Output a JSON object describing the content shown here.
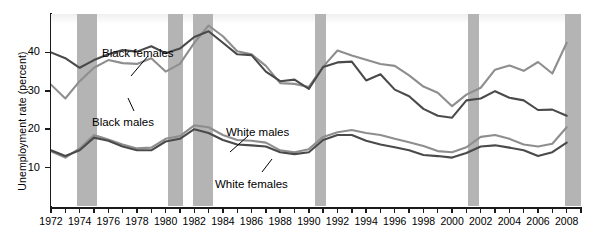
{
  "chart_data": {
    "type": "line",
    "title": "",
    "xlabel": "",
    "ylabel": "Unemployment rate (percent)",
    "xlim": [
      1972,
      2009
    ],
    "ylim": [
      0,
      50
    ],
    "yticks": [
      10,
      20,
      30,
      40
    ],
    "ytick_labels": [
      "10",
      "20",
      "30",
      "40"
    ],
    "x": [
      1972,
      1973,
      1974,
      1975,
      1976,
      1977,
      1978,
      1979,
      1980,
      1981,
      1982,
      1983,
      1984,
      1985,
      1986,
      1987,
      1988,
      1989,
      1990,
      1991,
      1992,
      1993,
      1994,
      1995,
      1996,
      1997,
      1998,
      1999,
      2000,
      2001,
      2002,
      2003,
      2004,
      2005,
      2006,
      2007,
      2008
    ],
    "xtick_labels": [
      "1972",
      "1974",
      "1976",
      "1978",
      "1980",
      "1982",
      "1984",
      "1986",
      "1988",
      "1990",
      "1992",
      "1994",
      "1996",
      "1998",
      "2000",
      "2002",
      "2004",
      "2006",
      "2008"
    ],
    "grid": false,
    "legend": "inline-annotations",
    "series": [
      {
        "name": "Black females",
        "color": "#4a4a4a",
        "values": [
          40.0,
          38.5,
          36.0,
          38.0,
          39.5,
          40.6,
          40.2,
          41.6,
          39.8,
          41.0,
          44.0,
          45.5,
          42.5,
          39.5,
          39.3,
          35.0,
          32.5,
          32.9,
          30.5,
          36.2,
          37.4,
          37.6,
          32.7,
          34.3,
          30.3,
          28.6,
          25.3,
          23.5,
          23.0,
          27.5,
          28.0,
          29.9,
          28.2,
          27.5,
          25.0,
          25.1,
          23.5
        ]
      },
      {
        "name": "Black males",
        "color": "#8e8e8e",
        "values": [
          31.6,
          28.0,
          32.5,
          36.0,
          38.0,
          37.2,
          37.0,
          38.5,
          35.0,
          37.0,
          42.5,
          47.0,
          44.2,
          40.3,
          39.5,
          36.5,
          32.0,
          31.8,
          31.0,
          36.3,
          40.5,
          39.2,
          38.1,
          37.0,
          36.5,
          34.0,
          31.1,
          29.5,
          26.0,
          29.0,
          30.8,
          35.5,
          36.6,
          35.2,
          37.5,
          34.5,
          42.5
        ]
      },
      {
        "name": "White males",
        "color": "#8e8e8e",
        "values": [
          14.2,
          12.6,
          15.0,
          18.5,
          17.3,
          16.0,
          15.0,
          15.2,
          17.5,
          18.2,
          21.0,
          20.5,
          18.5,
          17.2,
          17.0,
          16.5,
          14.5,
          14.0,
          14.8,
          18.0,
          19.2,
          19.8,
          19.0,
          18.5,
          17.5,
          16.6,
          15.6,
          14.3,
          14.0,
          15.3,
          18.0,
          18.5,
          17.5,
          16.0,
          15.5,
          16.2,
          20.5
        ]
      },
      {
        "name": "White females",
        "color": "#4a4a4a",
        "values": [
          14.5,
          13.0,
          14.5,
          17.8,
          17.0,
          15.5,
          14.5,
          14.5,
          16.8,
          17.5,
          20.0,
          19.0,
          17.2,
          16.0,
          15.8,
          15.5,
          14.0,
          13.5,
          14.0,
          17.2,
          18.5,
          18.5,
          17.0,
          16.0,
          15.3,
          14.5,
          13.3,
          13.0,
          12.6,
          13.8,
          15.5,
          15.8,
          15.2,
          14.5,
          13.0,
          14.0,
          16.5
        ]
      }
    ],
    "recession_bands": [
      {
        "start": 1973.8,
        "end": 1975.2
      },
      {
        "start": 1980.2,
        "end": 1981.2
      },
      {
        "start": 1981.9,
        "end": 1983.3
      },
      {
        "start": 1990.4,
        "end": 1991.2
      },
      {
        "start": 2001.1,
        "end": 2001.9
      },
      {
        "start": 2007.9,
        "end": 2009.0
      }
    ],
    "annotations": [
      {
        "text": "Black females",
        "x": 102,
        "y": 47
      },
      {
        "text": "Black males",
        "x": 92,
        "y": 116
      },
      {
        "text": "White males",
        "x": 226,
        "y": 126
      },
      {
        "text": "White females",
        "x": 215,
        "y": 178
      }
    ],
    "colors": {
      "series_dark": "#4a4a4a",
      "series_light": "#8e8e8e",
      "recession_band": "#b4b4b4",
      "axis": "#1a1a1a",
      "background": "#ffffff"
    }
  }
}
